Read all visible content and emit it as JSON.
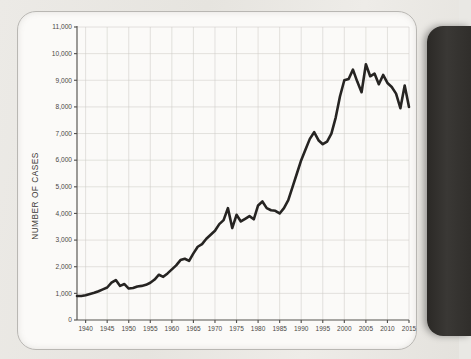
{
  "page": {
    "background_color": "#e9e8e4",
    "card_color": "#fbfaf8",
    "edge_color": "#2b2926"
  },
  "chart_data": {
    "type": "line",
    "title": "",
    "xlabel": "",
    "ylabel": "NUMBER OF CASES",
    "xlim": [
      1938,
      2015
    ],
    "ylim": [
      0,
      11000
    ],
    "grid": true,
    "legend": null,
    "line_color": "#262422",
    "grid_color": "#cdcbc7",
    "y_ticks": [
      0,
      1000,
      2000,
      3000,
      4000,
      5000,
      6000,
      7000,
      8000,
      9000,
      10000,
      11000
    ],
    "y_tick_labels": [
      "0",
      "1,000",
      "2,000",
      "3,000",
      "4,000",
      "5,000",
      "6,000",
      "7,000",
      "8,000",
      "9,000",
      "10,000",
      "11,000"
    ],
    "x_ticks": [
      1940,
      1945,
      1950,
      1955,
      1960,
      1965,
      1970,
      1975,
      1980,
      1985,
      1990,
      1995,
      2000,
      2005,
      2010,
      2015
    ],
    "x_tick_labels": [
      "1940",
      "1945",
      "1950",
      "1955",
      "1960",
      "1965",
      "1970",
      "1975",
      "1980",
      "1985",
      "1990",
      "1995",
      "2000",
      "2005",
      "2010",
      "2015"
    ],
    "series": [
      {
        "name": "Number of cases",
        "x": [
          1938,
          1939,
          1940,
          1941,
          1942,
          1943,
          1944,
          1945,
          1946,
          1947,
          1948,
          1949,
          1950,
          1951,
          1952,
          1953,
          1954,
          1955,
          1956,
          1957,
          1958,
          1959,
          1960,
          1961,
          1962,
          1963,
          1964,
          1965,
          1966,
          1967,
          1968,
          1969,
          1970,
          1971,
          1972,
          1973,
          1974,
          1975,
          1976,
          1977,
          1978,
          1979,
          1980,
          1981,
          1982,
          1983,
          1984,
          1985,
          1986,
          1987,
          1988,
          1989,
          1990,
          1991,
          1992,
          1993,
          1994,
          1995,
          1996,
          1997,
          1998,
          1999,
          2000,
          2001,
          2002,
          2003,
          2004,
          2005,
          2006,
          2007,
          2008,
          2009,
          2010,
          2011,
          2012,
          2013,
          2014,
          2015
        ],
        "values": [
          900,
          900,
          930,
          980,
          1020,
          1080,
          1150,
          1220,
          1400,
          1500,
          1280,
          1350,
          1180,
          1200,
          1260,
          1280,
          1320,
          1400,
          1520,
          1700,
          1620,
          1750,
          1900,
          2050,
          2250,
          2300,
          2220,
          2500,
          2750,
          2850,
          3050,
          3200,
          3350,
          3600,
          3750,
          4200,
          3450,
          3950,
          3700,
          3800,
          3900,
          3780,
          4300,
          4450,
          4200,
          4120,
          4100,
          4000,
          4200,
          4500,
          5000,
          5500,
          6000,
          6400,
          6800,
          7050,
          6750,
          6600,
          6700,
          7000,
          7600,
          8400,
          9000,
          9050,
          9400,
          8950,
          8550,
          9600,
          9150,
          9250,
          8850,
          9200,
          8900,
          8750,
          8500,
          7950,
          8800,
          8000
        ]
      }
    ]
  },
  "axis": {
    "y_title": "NUMBER OF CASES"
  }
}
